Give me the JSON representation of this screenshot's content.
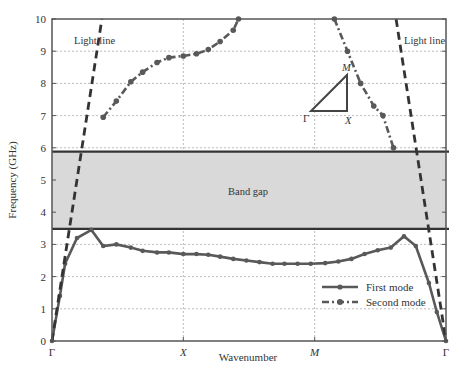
{
  "chart_data": {
    "type": "line",
    "title": "",
    "xlabel": "Wavenumber",
    "ylabel": "Frequency (GHz)",
    "xlim": [
      0,
      3
    ],
    "ylim": [
      0,
      10
    ],
    "x_ticks": [
      {
        "pos": 0,
        "label": "Γ"
      },
      {
        "pos": 1,
        "label": "X"
      },
      {
        "pos": 2,
        "label": "M"
      },
      {
        "pos": 3,
        "label": "Γ"
      }
    ],
    "y_ticks": [
      0,
      1,
      2,
      3,
      4,
      5,
      6,
      7,
      8,
      9,
      10
    ],
    "grid": true,
    "legend_position": "lower right",
    "band_gap": {
      "lower": 3.48,
      "upper": 5.88,
      "label": "Band gap"
    },
    "series": [
      {
        "name": "First mode",
        "style": "solid-with-markers",
        "x": [
          0,
          0.06,
          0.1,
          0.19,
          0.3,
          0.39,
          0.49,
          0.6,
          0.69,
          0.8,
          0.89,
          1.0,
          1.1,
          1.19,
          1.28,
          1.38,
          1.48,
          1.58,
          1.68,
          1.77,
          1.87,
          1.97,
          2.08,
          2.18,
          2.28,
          2.38,
          2.48,
          2.58,
          2.68,
          2.77,
          2.87,
          2.93,
          3.0
        ],
        "values": [
          0,
          1.4,
          2.4,
          3.2,
          3.45,
          2.95,
          3.0,
          2.9,
          2.8,
          2.75,
          2.75,
          2.7,
          2.7,
          2.68,
          2.62,
          2.55,
          2.5,
          2.45,
          2.4,
          2.4,
          2.4,
          2.4,
          2.42,
          2.47,
          2.55,
          2.7,
          2.82,
          2.9,
          3.25,
          2.95,
          1.8,
          0.9,
          0
        ]
      },
      {
        "name": "Second mode",
        "style": "dash-dot-with-markers",
        "x": [
          0.39,
          0.49,
          0.6,
          0.69,
          0.8,
          0.89,
          1.0,
          1.1,
          1.19,
          1.28,
          1.38,
          1.42
        ],
        "values": [
          6.95,
          7.45,
          8.05,
          8.35,
          8.65,
          8.8,
          8.85,
          8.92,
          9.05,
          9.3,
          9.65,
          10.0
        ],
        "x_right": [
          2.15,
          2.25,
          2.35,
          2.45,
          2.52,
          2.6
        ],
        "values_right": [
          10.0,
          9.0,
          8.0,
          7.3,
          7.0,
          6.0
        ]
      },
      {
        "name": "Light line (left)",
        "style": "dashed",
        "x": [
          0,
          0.38
        ],
        "values": [
          0,
          10
        ]
      },
      {
        "name": "Light line (right)",
        "style": "dashed",
        "x": [
          2.62,
          3.0
        ],
        "values": [
          10,
          0
        ]
      }
    ],
    "annotations": [
      {
        "text": "Light line",
        "x": 0.22,
        "y": 9.7
      },
      {
        "text": "Light line",
        "x": 2.84,
        "y": 9.7
      },
      {
        "text": "Band gap",
        "x": 1.3,
        "y": 4.68
      },
      {
        "text": "Γ",
        "note": "inset triangle vertex"
      },
      {
        "text": "X",
        "note": "inset triangle vertex"
      },
      {
        "text": "M",
        "note": "inset triangle vertex"
      }
    ]
  },
  "labels": {
    "xlabel": "Wavenumber",
    "ylabel": "Frequency (GHz)",
    "light_line_left": "Light line",
    "light_line_right": "Light line",
    "band_gap": "Band gap",
    "legend_first": "First mode",
    "legend_second": "Second mode",
    "inset_gamma": "Γ",
    "inset_x": "X",
    "inset_m": "M",
    "xticks": [
      "Γ",
      "X",
      "M",
      "Γ"
    ],
    "yticks": [
      "0",
      "1",
      "2",
      "3",
      "4",
      "5",
      "6",
      "7",
      "8",
      "9",
      "10"
    ]
  },
  "colors": {
    "curve": "#595959",
    "band_fill": "#d9d9d9",
    "band_edge": "#333333",
    "grid": "#bbbbbb",
    "axis": "#555555"
  }
}
